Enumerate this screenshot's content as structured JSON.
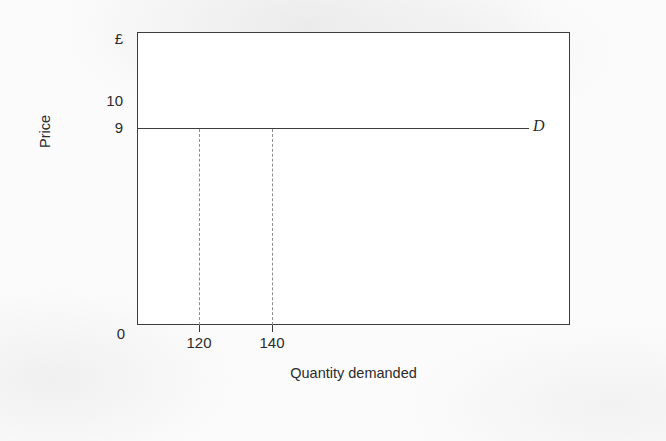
{
  "figure": {
    "background_color": "#fbfbfb",
    "plot_background_color": "#ffffff",
    "line_color": "#3c3c3c",
    "dash_color": "#8e8e8e",
    "text_color": "#2b2b2b"
  },
  "axes": {
    "y_currency_symbol": "£",
    "y_tick_10": "10",
    "y_tick_9": "9",
    "origin": "0",
    "x_tick_120": "120",
    "x_tick_140": "140",
    "y_title": "Price",
    "x_title": "Quantity demanded"
  },
  "series": {
    "demand_label": "D"
  },
  "chart_data": {
    "type": "line",
    "title": "",
    "subtitle": "",
    "xlabel": "Quantity demanded",
    "ylabel": "Price",
    "xlim": [
      0,
      260
    ],
    "ylim": [
      0,
      11
    ],
    "grid": false,
    "legend": "inline-right",
    "y_currency_unit": "£",
    "y_tick_labels": [
      "0",
      "9",
      "10",
      "£"
    ],
    "y_tick_values": [
      0,
      9,
      10,
      11
    ],
    "x_tick_labels": [
      "0",
      "120",
      "140"
    ],
    "x_tick_values": [
      0,
      120,
      140
    ],
    "series": [
      {
        "name": "D",
        "description": "Perfectly elastic demand curve: horizontal at price 9",
        "x": [
          0,
          120,
          140,
          235
        ],
        "values": [
          9,
          9,
          9,
          9
        ]
      }
    ],
    "annotations": [
      {
        "type": "dashed-vertical",
        "label": "120",
        "x": 120,
        "from_y": 0,
        "to_y": 9
      },
      {
        "type": "dashed-vertical",
        "label": "140",
        "x": 140,
        "from_y": 0,
        "to_y": 9
      },
      {
        "type": "series-label",
        "text": "D",
        "x": 243,
        "y": 9,
        "style": "italic"
      }
    ]
  }
}
